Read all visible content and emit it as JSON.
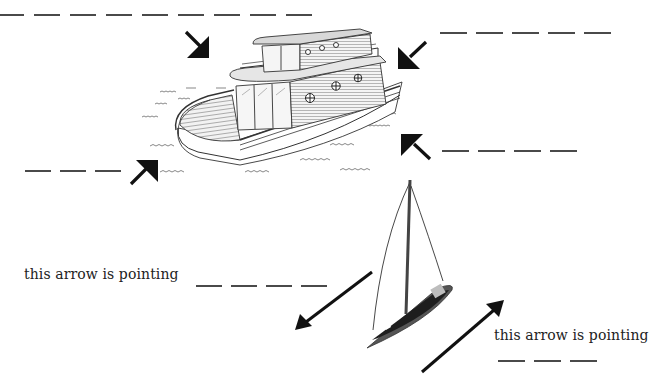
{
  "worksheet": {
    "colors": {
      "ink": "#111111",
      "blank_line": "#4a4a4a",
      "text": "#222222",
      "background": "#ffffff"
    },
    "houseboat": {
      "arrows": [
        {
          "id": "top-left",
          "direction": "down-right",
          "blank_segments": 9
        },
        {
          "id": "top-right",
          "direction": "down-left",
          "blank_segments": 5
        },
        {
          "id": "bottom-left",
          "direction": "up-right",
          "blank_segments": 3
        },
        {
          "id": "bottom-right",
          "direction": "up-left",
          "blank_segments": 4
        }
      ]
    },
    "sailboat": {
      "left_prompt": {
        "text": "this arrow is pointing",
        "arrow_direction": "down-left",
        "blank_segments": 4
      },
      "right_prompt": {
        "text": "this arrow is pointing",
        "arrow_direction": "up-right",
        "blank_segments": 3
      }
    }
  }
}
